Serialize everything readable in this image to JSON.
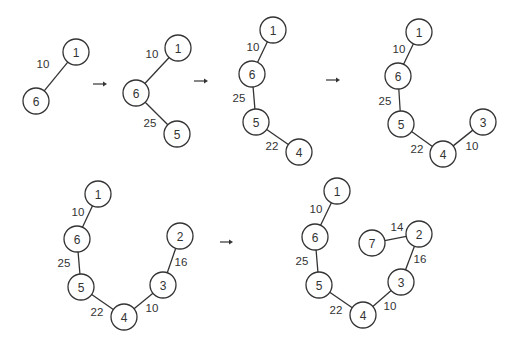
{
  "diagram": {
    "node_radius": 13,
    "stroke_color": "#333333",
    "background": "#ffffff",
    "steps": [
      {
        "id": "step-1",
        "nodes": [
          {
            "id": "1",
            "label": "1",
            "x": 76,
            "y": 52
          },
          {
            "id": "6",
            "label": "6",
            "x": 36,
            "y": 101
          }
        ],
        "edges": [
          {
            "from": "1",
            "to": "6",
            "weight": "10",
            "lx": 43,
            "ly": 64
          }
        ]
      },
      {
        "id": "step-2",
        "nodes": [
          {
            "id": "1",
            "label": "1",
            "x": 178,
            "y": 48
          },
          {
            "id": "6",
            "label": "6",
            "x": 136,
            "y": 93
          },
          {
            "id": "5",
            "label": "5",
            "x": 177,
            "y": 134
          }
        ],
        "edges": [
          {
            "from": "1",
            "to": "6",
            "weight": "10",
            "lx": 152,
            "ly": 54
          },
          {
            "from": "6",
            "to": "5",
            "weight": "25",
            "lx": 150,
            "ly": 123
          }
        ]
      },
      {
        "id": "step-3",
        "nodes": [
          {
            "id": "1",
            "label": "1",
            "x": 273,
            "y": 30
          },
          {
            "id": "6",
            "label": "6",
            "x": 252,
            "y": 74
          },
          {
            "id": "5",
            "label": "5",
            "x": 256,
            "y": 122
          },
          {
            "id": "4",
            "label": "4",
            "x": 299,
            "y": 152
          }
        ],
        "edges": [
          {
            "from": "1",
            "to": "6",
            "weight": "10",
            "lx": 253,
            "ly": 47
          },
          {
            "from": "6",
            "to": "5",
            "weight": "25",
            "lx": 239,
            "ly": 98
          },
          {
            "from": "5",
            "to": "4",
            "weight": "22",
            "lx": 272,
            "ly": 146
          }
        ]
      },
      {
        "id": "step-4",
        "nodes": [
          {
            "id": "1",
            "label": "1",
            "x": 419,
            "y": 32
          },
          {
            "id": "6",
            "label": "6",
            "x": 398,
            "y": 76
          },
          {
            "id": "5",
            "label": "5",
            "x": 401,
            "y": 124
          },
          {
            "id": "4",
            "label": "4",
            "x": 443,
            "y": 154
          },
          {
            "id": "3",
            "label": "3",
            "x": 483,
            "y": 122
          }
        ],
        "edges": [
          {
            "from": "1",
            "to": "6",
            "weight": "10",
            "lx": 399,
            "ly": 49
          },
          {
            "from": "6",
            "to": "5",
            "weight": "25",
            "lx": 385,
            "ly": 101
          },
          {
            "from": "5",
            "to": "4",
            "weight": "22",
            "lx": 417,
            "ly": 149
          },
          {
            "from": "4",
            "to": "3",
            "weight": "10",
            "lx": 472,
            "ly": 146
          }
        ]
      },
      {
        "id": "step-5",
        "nodes": [
          {
            "id": "1",
            "label": "1",
            "x": 98,
            "y": 194
          },
          {
            "id": "6",
            "label": "6",
            "x": 77,
            "y": 239
          },
          {
            "id": "5",
            "label": "5",
            "x": 81,
            "y": 287
          },
          {
            "id": "4",
            "label": "4",
            "x": 124,
            "y": 317
          },
          {
            "id": "3",
            "label": "3",
            "x": 163,
            "y": 285
          },
          {
            "id": "2",
            "label": "2",
            "x": 180,
            "y": 236
          }
        ],
        "edges": [
          {
            "from": "1",
            "to": "6",
            "weight": "10",
            "lx": 78,
            "ly": 212
          },
          {
            "from": "6",
            "to": "5",
            "weight": "25",
            "lx": 64,
            "ly": 263
          },
          {
            "from": "5",
            "to": "4",
            "weight": "22",
            "lx": 97,
            "ly": 312
          },
          {
            "from": "4",
            "to": "3",
            "weight": "10",
            "lx": 152,
            "ly": 308
          },
          {
            "from": "3",
            "to": "2",
            "weight": "16",
            "lx": 181,
            "ly": 262
          }
        ]
      },
      {
        "id": "step-6",
        "nodes": [
          {
            "id": "1",
            "label": "1",
            "x": 337,
            "y": 191
          },
          {
            "id": "6",
            "label": "6",
            "x": 315,
            "y": 237
          },
          {
            "id": "5",
            "label": "5",
            "x": 319,
            "y": 285
          },
          {
            "id": "4",
            "label": "4",
            "x": 363,
            "y": 315
          },
          {
            "id": "3",
            "label": "3",
            "x": 401,
            "y": 282
          },
          {
            "id": "2",
            "label": "2",
            "x": 419,
            "y": 234
          },
          {
            "id": "7",
            "label": "7",
            "x": 372,
            "y": 243
          }
        ],
        "edges": [
          {
            "from": "1",
            "to": "6",
            "weight": "10",
            "lx": 316,
            "ly": 209
          },
          {
            "from": "6",
            "to": "5",
            "weight": "25",
            "lx": 302,
            "ly": 261
          },
          {
            "from": "5",
            "to": "4",
            "weight": "22",
            "lx": 336,
            "ly": 310
          },
          {
            "from": "4",
            "to": "3",
            "weight": "10",
            "lx": 390,
            "ly": 306
          },
          {
            "from": "3",
            "to": "2",
            "weight": "16",
            "lx": 420,
            "ly": 259
          },
          {
            "from": "7",
            "to": "2",
            "weight": "14",
            "lx": 397,
            "ly": 227
          }
        ]
      }
    ],
    "arrows": [
      {
        "id": "arrow-1-2",
        "x1": 93,
        "x2": 107,
        "y": 84
      },
      {
        "id": "arrow-2-3",
        "x1": 194,
        "x2": 208,
        "y": 81
      },
      {
        "id": "arrow-3-4",
        "x1": 326,
        "x2": 340,
        "y": 80
      },
      {
        "id": "arrow-5-6",
        "x1": 220,
        "x2": 233,
        "y": 242
      }
    ]
  }
}
